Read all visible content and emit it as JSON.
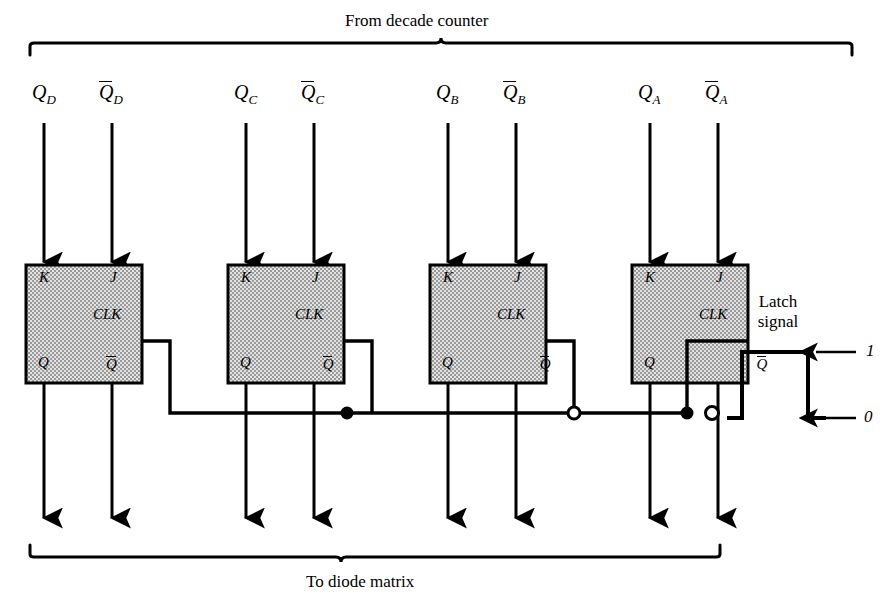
{
  "diagram": {
    "title_top": "From decade counter",
    "title_bottom": "To diode matrix",
    "latch_label_line1": "Latch",
    "latch_label_line2": "signal",
    "waveform_high_label": "1",
    "waveform_low_label": "0",
    "ink_color": "#000000",
    "box_fill_color": "#d8d8d8",
    "background_color": "#ffffff"
  },
  "inputs": [
    {
      "name": "Q_D",
      "base": "Q",
      "sub": "D",
      "overbar": false
    },
    {
      "name": "Qbar_D",
      "base": "Q",
      "sub": "D",
      "overbar": true
    },
    {
      "name": "Q_C",
      "base": "Q",
      "sub": "C",
      "overbar": false
    },
    {
      "name": "Qbar_C",
      "base": "Q",
      "sub": "C",
      "overbar": true
    },
    {
      "name": "Q_B",
      "base": "Q",
      "sub": "B",
      "overbar": false
    },
    {
      "name": "Qbar_B",
      "base": "Q",
      "sub": "B",
      "overbar": true
    },
    {
      "name": "Q_A",
      "base": "Q",
      "sub": "A",
      "overbar": false
    },
    {
      "name": "Qbar_A",
      "base": "Q",
      "sub": "A",
      "overbar": true
    }
  ],
  "flipflops": [
    {
      "id": "ff-d",
      "k": "K",
      "j": "J",
      "clk": "CLK",
      "q": "Q",
      "qbar": "Q"
    },
    {
      "id": "ff-c",
      "k": "K",
      "j": "J",
      "clk": "CLK",
      "q": "Q",
      "qbar": "Q"
    },
    {
      "id": "ff-b",
      "k": "K",
      "j": "J",
      "clk": "CLK",
      "q": "Q",
      "qbar": "Q"
    },
    {
      "id": "ff-a",
      "k": "K",
      "j": "J",
      "clk": "CLK",
      "q": "Q",
      "qbar": "Q"
    }
  ]
}
